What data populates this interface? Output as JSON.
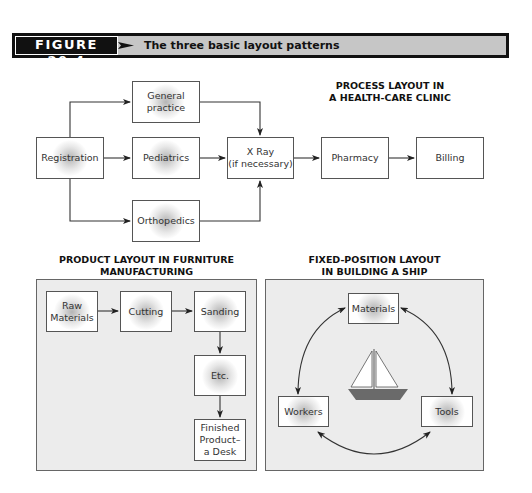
{
  "header": {
    "figure_label": "FIGURE 20.4",
    "caption": "The three basic layout patterns"
  },
  "process_layout": {
    "title_line1": "PROCESS LAYOUT IN",
    "title_line2": "A HEALTH-CARE CLINIC",
    "boxes": {
      "registration": "Registration",
      "general_practice_1": "General",
      "general_practice_2": "practice",
      "pediatrics": "Pediatrics",
      "orthopedics": "Orthopedics",
      "xray_1": "X Ray",
      "xray_2": "(if necessary)",
      "pharmacy": "Pharmacy",
      "billing": "Billing"
    }
  },
  "product_layout": {
    "title_line1": "PRODUCT LAYOUT IN FURNITURE",
    "title_line2": "MANUFACTURING",
    "boxes": {
      "raw_materials_1": "Raw",
      "raw_materials_2": "Materials",
      "cutting": "Cutting",
      "sanding": "Sanding",
      "etc": "Etc.",
      "finished_1": "Finished",
      "finished_2": "Product–",
      "finished_3": "a Desk"
    }
  },
  "fixed_position_layout": {
    "title_line1": "FIXED-POSITION LAYOUT",
    "title_line2": "IN BUILDING A SHIP",
    "boxes": {
      "materials": "Materials",
      "workers": "Workers",
      "tools": "Tools"
    },
    "center_icon": "sailboat-icon"
  },
  "colors": {
    "header_black": "#111111",
    "header_gray": "#c6c6c6",
    "panel_bg": "#ececec",
    "hull": "#6a6a6a"
  }
}
